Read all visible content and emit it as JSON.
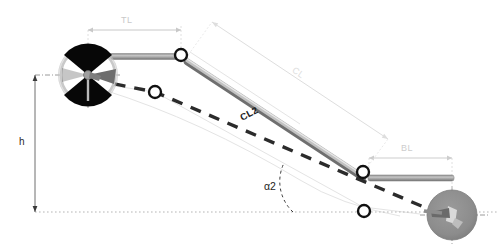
{
  "figure": {
    "background_color": "#ffffff"
  },
  "labels": {
    "top_length": "TL",
    "bottom_length": "BL",
    "connecting_length": "CL",
    "connecting_length_2": "CL2",
    "height": "h",
    "angle_2": "α2"
  },
  "colors": {
    "link_bar": "#a0a0a0",
    "link_bar_edge": "#6e6e6e",
    "dashed_path": "#2b2b2b",
    "joint_stroke": "#111111",
    "joint_fill": "#ffffff",
    "dimension_line": "#c8c8c8",
    "dimension_line_faint": "#dcdcdc",
    "baseline": "#b5b5b5",
    "front_rotor_blade": "#050505",
    "front_rotor_ring": "#d8d8d8",
    "rear_rotor_disc": "#8f8f8f",
    "guide_outline": "#e2e2e2"
  },
  "geometry": {
    "front_rotor": {
      "cx": 88,
      "cy": 75,
      "r": 28,
      "label": "front-rotor"
    },
    "rear_rotor": {
      "cx": 452,
      "cy": 215,
      "r": 25,
      "label": "rear-rotor"
    },
    "joints": [
      {
        "id": "top-front-joint",
        "cx": 181,
        "cy": 55,
        "r": 6
      },
      {
        "id": "mid-front-joint",
        "cx": 155,
        "cy": 92,
        "r": 6
      },
      {
        "id": "top-rear-joint",
        "cx": 363,
        "cy": 172,
        "r": 6
      },
      {
        "id": "bottom-rear-joint",
        "cx": 364,
        "cy": 211,
        "r": 6
      }
    ],
    "top_arm": {
      "x1": 93,
      "y1": 57,
      "x2": 178,
      "y2": 57
    },
    "bottom_arm": {
      "x1": 369,
      "y1": 178,
      "x2": 452,
      "y2": 178
    },
    "main_link": {
      "x1": 186,
      "y1": 60,
      "x2": 362,
      "y2": 176
    },
    "baseline_y": 212,
    "centerline_y": 75,
    "dim_tl": {
      "x1": 88,
      "x2": 181,
      "y": 30
    },
    "dim_bl": {
      "x1": 369,
      "x2": 452,
      "y": 158
    },
    "dim_cl": {
      "x1": 212,
      "y1": 22,
      "x2": 388,
      "y2": 139
    },
    "dim_h": {
      "x": 35,
      "y1": 75,
      "y2": 212
    },
    "angle_vertex": {
      "x": 293,
      "y": 212
    },
    "angle_value_deg": 33
  }
}
